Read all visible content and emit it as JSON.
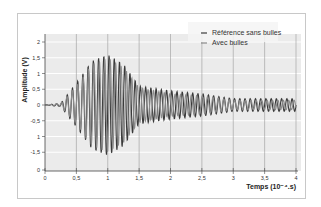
{
  "chart_data": {
    "type": "line",
    "title": "",
    "xlabel": "Temps (10⁻⁴.s)",
    "ylabel": "Amplitude (V)",
    "xlim": [
      0,
      4
    ],
    "ylim": [
      -2,
      2.2
    ],
    "x_ticks": [
      "0",
      "0,5",
      "1",
      "1,5",
      "2",
      "2,5",
      "3",
      "3,5",
      "4"
    ],
    "y_ticks": [
      "2",
      "1,5",
      "1",
      "0,5",
      "0",
      "-0,5",
      "1",
      "-1,5",
      "0"
    ],
    "grid": true,
    "legend_position": "top-right",
    "series": [
      {
        "name": "Référence sans bulles",
        "color": "#3a3a3a",
        "description": "Burst oscillation starting ~0.25, envelope peaking ~1.6 V near t=1.0, decaying to ~0.5 V by t=2, then ~0.2 V oscillation to t=4",
        "envelope": [
          [
            0,
            0
          ],
          [
            0.25,
            0.05
          ],
          [
            0.5,
            0.7
          ],
          [
            0.75,
            1.4
          ],
          [
            1.0,
            1.6
          ],
          [
            1.25,
            1.3
          ],
          [
            1.5,
            0.6
          ],
          [
            2.0,
            0.45
          ],
          [
            2.5,
            0.35
          ],
          [
            3.0,
            0.2
          ],
          [
            3.5,
            0.2
          ],
          [
            4.0,
            0.2
          ]
        ]
      },
      {
        "name": "Avec bulles",
        "color": "#8a8a8a",
        "description": "Similar oscillation with lower amplitude after 1.5, ~0.3 V peak oscillations at t>2, nearly in phase early then drifting",
        "envelope": [
          [
            0,
            0
          ],
          [
            0.25,
            0.05
          ],
          [
            0.5,
            0.6
          ],
          [
            0.75,
            1.3
          ],
          [
            1.0,
            1.5
          ],
          [
            1.25,
            1.2
          ],
          [
            1.5,
            0.55
          ],
          [
            2.0,
            0.35
          ],
          [
            2.5,
            0.3
          ],
          [
            3.0,
            0.15
          ],
          [
            3.5,
            0.15
          ],
          [
            4.0,
            0.15
          ]
        ]
      }
    ]
  },
  "legend": {
    "items": [
      {
        "label": "Référence sans bulles",
        "color": "#3a3a3a"
      },
      {
        "label": "Avec bulles",
        "color": "#8a8a8a"
      }
    ]
  },
  "axes": {
    "x_title": "Temps (10⁻⁴.s)",
    "y_title": "Amplitude (V)"
  }
}
